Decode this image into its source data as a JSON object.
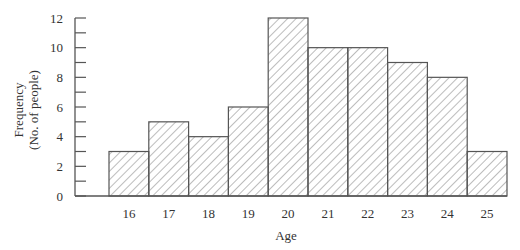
{
  "chart_data": {
    "type": "bar",
    "subtype": "histogram",
    "title": "",
    "xlabel": "Age",
    "ylabel": "Frequency",
    "ylabel_sub": "(No. of people)",
    "categories": [
      "16",
      "17",
      "18",
      "19",
      "20",
      "21",
      "22",
      "23",
      "24",
      "25"
    ],
    "values": [
      3,
      5,
      4,
      6,
      12,
      10,
      10,
      9,
      8,
      3
    ],
    "ylim": [
      0,
      12
    ],
    "y_ticks": [
      0,
      2,
      4,
      6,
      8,
      10,
      12
    ],
    "y_minor_tick_step": 1,
    "grid": false,
    "legend": null,
    "bar_fill": "diagonal hatch",
    "colors": {
      "stroke": "#555555",
      "hatch": "#777777",
      "background": "#ffffff"
    }
  }
}
